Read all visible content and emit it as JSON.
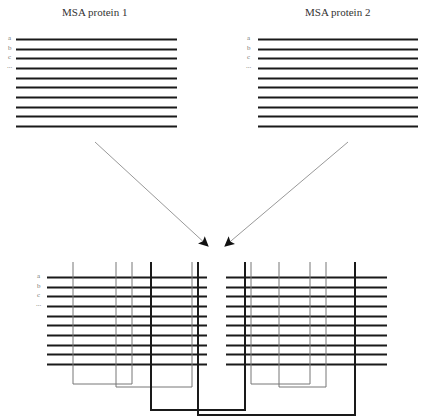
{
  "panels": {
    "msa1": {
      "title": "MSA protein 1"
    },
    "msa2": {
      "title": "MSA protein 2"
    }
  },
  "row_labels": [
    "a",
    "b",
    "c",
    "..."
  ],
  "colors": {
    "line": "#1a1a1a",
    "thin": "#777777",
    "arrow": "#999999"
  },
  "layout": {
    "msa1_lines": {
      "x1": 16,
      "x2": 177,
      "y0": 39,
      "step": 9.65,
      "count": 10
    },
    "msa2_lines": {
      "x1": 258,
      "x2": 418,
      "y0": 39,
      "step": 9.65,
      "count": 10
    },
    "bottom_left_lines": {
      "x1": 47,
      "x2": 207,
      "y0": 277,
      "step": 9.65,
      "count": 10
    },
    "bottom_right_lines": {
      "x1": 226,
      "x2": 387,
      "y0": 277,
      "step": 9.65,
      "count": 10
    },
    "connectors": [
      {
        "type": "thin",
        "xa": 73,
        "xb": 132,
        "ybottom": 384
      },
      {
        "type": "thin",
        "xa": 116,
        "xb": 192,
        "ybottom": 387
      },
      {
        "type": "thick",
        "xa": 151,
        "xb": 245,
        "ybottom": 410
      },
      {
        "type": "thick",
        "xa": 198,
        "xb": 355,
        "ybottom": 415
      },
      {
        "type": "thin",
        "xa": 251,
        "xb": 310,
        "ybottom": 384
      },
      {
        "type": "thin",
        "xa": 279,
        "xb": 326,
        "ybottom": 387
      }
    ],
    "vertical_top": 262,
    "arrows": [
      {
        "x1": 95,
        "y1": 142,
        "x2": 208,
        "y2": 246
      },
      {
        "x1": 348,
        "y1": 142,
        "x2": 225,
        "y2": 246
      }
    ]
  }
}
